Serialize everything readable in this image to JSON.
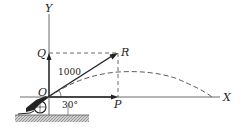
{
  "diagram": {
    "axes": {
      "x_label": "X",
      "y_label": "Y"
    },
    "points": {
      "origin": "O",
      "q": "Q",
      "r": "R",
      "p": "P"
    },
    "vector_magnitude": "1000",
    "angle_label": "30°",
    "colors": {
      "line": "#222222",
      "ground": "#999999"
    }
  }
}
